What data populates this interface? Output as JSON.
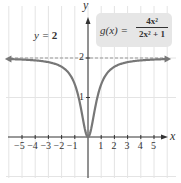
{
  "chart_data": {
    "type": "line",
    "title": "",
    "function_label": "g(x) = 4x² / (2x² + 1)",
    "function_lhs": "g(x) =",
    "function_numerator": "4x²",
    "function_denominator": "2x² + 1",
    "asymptote_label": "y = 2",
    "asymptote_lhs": "y = ",
    "asymptote_value": "2",
    "xlabel": "x",
    "ylabel": "y",
    "x_ticks": [
      "−5",
      "−4",
      "−3",
      "−2",
      "−1",
      "1",
      "2",
      "3",
      "4",
      "5"
    ],
    "y_ticks": [
      "1",
      "2"
    ],
    "xlim": [
      -6.5,
      6
    ],
    "ylim": [
      -1.2,
      3.3
    ],
    "grid": true,
    "legend": "none",
    "series": [
      {
        "name": "g(x)",
        "x": [
          -6,
          -5,
          -4,
          -3,
          -2,
          -1,
          -0.5,
          0,
          0.5,
          1,
          2,
          3,
          4,
          5,
          6
        ],
        "values": [
          1.97,
          1.96,
          1.94,
          1.89,
          1.78,
          1.33,
          0.67,
          0,
          0.67,
          1.33,
          1.78,
          1.89,
          1.94,
          1.96,
          1.97
        ]
      },
      {
        "name": "horizontal asymptote y = 2",
        "style": "dashed",
        "x": [
          -6,
          6
        ],
        "values": [
          2,
          2
        ]
      }
    ]
  },
  "colors": {
    "curve": "#777777",
    "axis": "#333333",
    "grid": "#e4e4e4",
    "asymptote": "#999999",
    "label_box": "#e6e6e6"
  }
}
